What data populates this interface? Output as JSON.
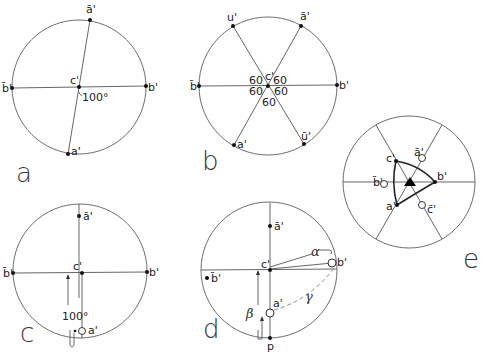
{
  "figure": {
    "panels": [
      {
        "id": "a",
        "label": "a",
        "points": {
          "a_bar": "ā'",
          "b_bar": "b̄'",
          "c": "c'",
          "b": "b'",
          "a": "a'"
        },
        "angle_label": "100°"
      },
      {
        "id": "b",
        "label": "b",
        "points": {
          "u": "u'",
          "a_bar": "ā'",
          "b_bar": "b̄'",
          "b": "b'",
          "a": "a'",
          "u_bar": "ū'",
          "c": "c'"
        },
        "angle_labels": [
          "60",
          "60",
          "60",
          "60",
          "60"
        ]
      },
      {
        "id": "c",
        "label": "c",
        "points": {
          "a_bar": "ā'",
          "b_bar": "b̄'",
          "c": "c'",
          "b": "b'",
          "a": "a'"
        },
        "angle_label": "100°"
      },
      {
        "id": "d",
        "label": "d",
        "points": {
          "a_bar": "ā'",
          "b_bar": "b̄'",
          "c": "c'",
          "b": "b'",
          "a": "a'",
          "p": "p"
        },
        "greek": {
          "alpha": "α",
          "beta": "β",
          "gamma": "γ"
        }
      },
      {
        "id": "e",
        "label": "e",
        "points": {
          "c": "c'",
          "a_bar": "ā'",
          "b_bar": "b̄'",
          "b": "b'",
          "a": "a'",
          "c_bar": "c̄'"
        }
      }
    ]
  }
}
